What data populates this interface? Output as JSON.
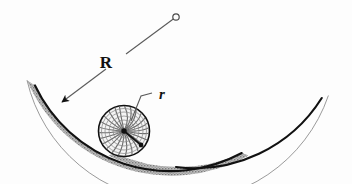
{
  "figure": {
    "kind": "physics-diagram",
    "background_color": "#fdfdfd",
    "width": 352,
    "height": 184
  },
  "labels": {
    "radius_of_curvature": "R",
    "disk_radius": "r"
  },
  "colors": {
    "outline": "#111111",
    "bowl_band": "#9b9b9b",
    "bowl_band_light": "#c9c9c9",
    "leader_line": "#555555",
    "disk_fill": "#f2f2f2",
    "disk_texture": "#6f6f6f",
    "marker": "#111111"
  },
  "geometry": {
    "bowl": {
      "center_of_curvature": {
        "x": 176,
        "y": 17
      },
      "inner_radius": 150,
      "band_thickness": 7,
      "start_angle_deg": 114,
      "end_angle_deg": 64,
      "left_tip": {
        "x": 33,
        "y": 77
      },
      "right_tip": {
        "x": 320,
        "y": 48
      }
    },
    "radius_line": {
      "from": {
        "x": 176,
        "y": 17
      },
      "to": {
        "x": 60,
        "y": 104
      },
      "arrow_tip": {
        "x": 60,
        "y": 104
      },
      "label_gap_center": {
        "x": 115,
        "y": 62
      }
    },
    "center_marker": {
      "x": 176,
      "y": 17,
      "radius": 3.2,
      "style": "open-circle"
    },
    "disk": {
      "center": {
        "x": 124,
        "y": 131
      },
      "radius": 26,
      "hub_dot": {
        "x": 124,
        "y": 131,
        "radius": 2.6
      },
      "spoke_end": {
        "x": 141,
        "y": 145
      },
      "spoke_dot_radius": 2.4,
      "texture": "spiral-hatch",
      "spiral_arm_count": 26
    },
    "r_leader": {
      "points": [
        {
          "x": 152,
          "y": 93
        },
        {
          "x": 141,
          "y": 96
        },
        {
          "x": 131,
          "y": 121
        }
      ],
      "label_anchor": {
        "x": 159,
        "y": 99
      }
    }
  }
}
